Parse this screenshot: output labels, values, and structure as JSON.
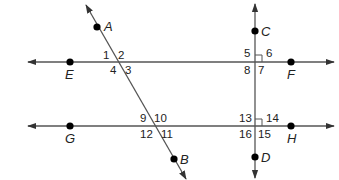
{
  "diagram": {
    "title": "",
    "width": 339,
    "height": 180,
    "colors": {
      "line": "#555555",
      "point": "#000000",
      "text": "#222222"
    },
    "lines": [
      {
        "id": "line-EF",
        "x1": 28,
        "y1": 62,
        "x2": 334,
        "y2": 62,
        "arrows": "both"
      },
      {
        "id": "line-GH",
        "x1": 28,
        "y1": 126,
        "x2": 334,
        "y2": 126,
        "arrows": "both"
      },
      {
        "id": "line-CD",
        "x1": 255,
        "y1": 4,
        "x2": 255,
        "y2": 178,
        "arrows": "both"
      },
      {
        "id": "line-AB",
        "x1": 86,
        "y1": 5,
        "x2": 186,
        "y2": 179,
        "arrows": "both"
      }
    ],
    "points": [
      {
        "name": "A",
        "x": 97,
        "y": 27,
        "lx": 104,
        "ly": 31
      },
      {
        "name": "B",
        "x": 174,
        "y": 159,
        "lx": 180,
        "ly": 164
      },
      {
        "name": "C",
        "x": 255,
        "y": 31,
        "lx": 261,
        "ly": 36
      },
      {
        "name": "D",
        "x": 255,
        "y": 157,
        "lx": 261,
        "ly": 162
      },
      {
        "name": "E",
        "x": 70,
        "y": 62,
        "lx": 65,
        "ly": 79
      },
      {
        "name": "F",
        "x": 291,
        "y": 62,
        "lx": 287,
        "ly": 79
      },
      {
        "name": "G",
        "x": 70,
        "y": 126,
        "lx": 65,
        "ly": 143
      },
      {
        "name": "H",
        "x": 291,
        "y": 126,
        "lx": 287,
        "ly": 143
      }
    ],
    "angle_labels": [
      {
        "text": "1",
        "x": 103,
        "y": 59
      },
      {
        "text": "2",
        "x": 118,
        "y": 59
      },
      {
        "text": "3",
        "x": 125,
        "y": 74
      },
      {
        "text": "4",
        "x": 110,
        "y": 74
      },
      {
        "text": "5",
        "x": 244,
        "y": 57
      },
      {
        "text": "6",
        "x": 266,
        "y": 57
      },
      {
        "text": "7",
        "x": 258,
        "y": 74
      },
      {
        "text": "8",
        "x": 244,
        "y": 74
      },
      {
        "text": "9",
        "x": 140,
        "y": 122
      },
      {
        "text": "10",
        "x": 154,
        "y": 122
      },
      {
        "text": "11",
        "x": 161,
        "y": 138
      },
      {
        "text": "12",
        "x": 140,
        "y": 138
      },
      {
        "text": "13",
        "x": 239,
        "y": 122
      },
      {
        "text": "14",
        "x": 266,
        "y": 122
      },
      {
        "text": "15",
        "x": 258,
        "y": 138
      },
      {
        "text": "16",
        "x": 239,
        "y": 138
      }
    ],
    "right_angles": [
      {
        "x": 255,
        "y": 62,
        "size": 7,
        "quadrant": "upper-right"
      },
      {
        "x": 255,
        "y": 126,
        "size": 7,
        "quadrant": "upper-right"
      }
    ]
  }
}
